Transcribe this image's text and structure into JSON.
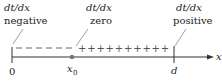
{
  "diagram": {
    "labels": {
      "left_top": "dt/dx",
      "left_bottom": "negative",
      "mid_top": "dt/dx",
      "mid_bottom": "zero",
      "right_top": "dt/dx",
      "right_bottom": "positive"
    },
    "axis": {
      "variable": "x",
      "origin_label": "0",
      "point_label": "x",
      "point_subscript": "0",
      "end_label": "d"
    },
    "signs": {
      "negative_count": 6,
      "positive_count": 10,
      "positive_symbol": "+"
    },
    "colors": {
      "axis": "#333333",
      "signs": "#666666",
      "point": "#777777"
    }
  }
}
